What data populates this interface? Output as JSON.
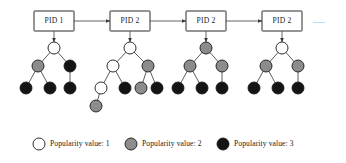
{
  "figure": {
    "type": "diagram",
    "continuation_marker": "......",
    "chain": {
      "boxes": [
        {
          "label": "PID 1"
        },
        {
          "label": "PID 2"
        },
        {
          "label": "PID 2"
        },
        {
          "label": "PID 2"
        }
      ]
    },
    "legend": {
      "items": [
        {
          "label": "Popularity value: 1",
          "value": 1,
          "fill": "#ffffff",
          "style": "white"
        },
        {
          "label": "Popularity value: 2",
          "value": 2,
          "fill": "#8c8c8c",
          "style": "gray"
        },
        {
          "label": "Popularity value: 3",
          "value": 3,
          "fill": "#141414",
          "style": "black"
        }
      ]
    },
    "trees": [
      {
        "name": "tree-1",
        "nodes": [
          {
            "id": "t1-root",
            "value": 1,
            "style": "white"
          },
          {
            "id": "t1-a",
            "value": 2,
            "style": "gray"
          },
          {
            "id": "t1-b",
            "value": 3,
            "style": "black"
          },
          {
            "id": "t1-a1",
            "value": 3,
            "style": "black"
          },
          {
            "id": "t1-a2",
            "value": 3,
            "style": "black"
          },
          {
            "id": "t1-b1",
            "value": 3,
            "style": "black"
          }
        ]
      },
      {
        "name": "tree-2",
        "nodes": [
          {
            "id": "t2-root",
            "value": 1,
            "style": "white"
          },
          {
            "id": "t2-a",
            "value": 1,
            "style": "white"
          },
          {
            "id": "t2-b",
            "value": 2,
            "style": "gray"
          },
          {
            "id": "t2-a1",
            "value": 1,
            "style": "white"
          },
          {
            "id": "t2-a2",
            "value": 3,
            "style": "black"
          },
          {
            "id": "t2-a1x",
            "value": 2,
            "style": "gray"
          },
          {
            "id": "t2-b1",
            "value": 2,
            "style": "gray"
          },
          {
            "id": "t2-b2",
            "value": 3,
            "style": "black"
          }
        ]
      },
      {
        "name": "tree-3",
        "nodes": [
          {
            "id": "t3-root",
            "value": 2,
            "style": "gray"
          },
          {
            "id": "t3-a",
            "value": 2,
            "style": "gray"
          },
          {
            "id": "t3-b",
            "value": 2,
            "style": "gray"
          },
          {
            "id": "t3-a1",
            "value": 3,
            "style": "black"
          },
          {
            "id": "t3-a2",
            "value": 3,
            "style": "black"
          },
          {
            "id": "t3-b1",
            "value": 3,
            "style": "black"
          }
        ]
      },
      {
        "name": "tree-4",
        "nodes": [
          {
            "id": "t4-root",
            "value": 1,
            "style": "white"
          },
          {
            "id": "t4-a",
            "value": 2,
            "style": "gray"
          },
          {
            "id": "t4-b",
            "value": 2,
            "style": "gray"
          },
          {
            "id": "t4-a1",
            "value": 3,
            "style": "black"
          },
          {
            "id": "t4-a2",
            "value": 3,
            "style": "black"
          },
          {
            "id": "t4-b1",
            "value": 3,
            "style": "black"
          }
        ]
      }
    ]
  }
}
